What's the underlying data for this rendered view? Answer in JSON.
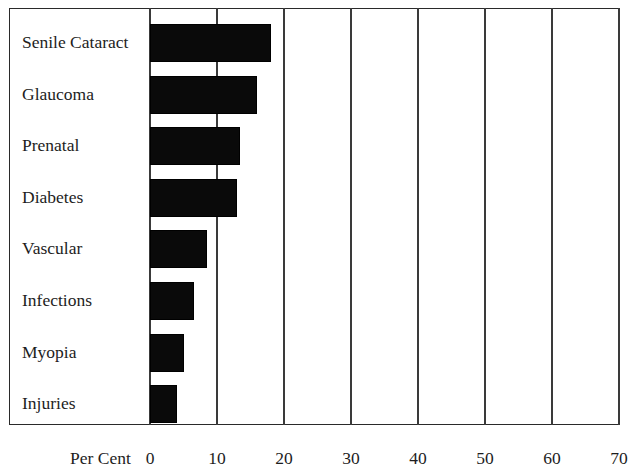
{
  "chart_data": {
    "type": "bar",
    "orientation": "horizontal",
    "title": "",
    "subtitle": "",
    "xlabel": "Per Cent",
    "ylabel": "",
    "categories": [
      "Senile Cataract",
      "Glaucoma",
      "Prenatal",
      "Diabetes",
      "Vascular",
      "Infections",
      "Myopia",
      "Injuries"
    ],
    "values": [
      18,
      16,
      13.5,
      13,
      8.5,
      6.5,
      5,
      4
    ],
    "xlim": [
      0,
      70
    ],
    "xticks": [
      0,
      10,
      20,
      30,
      40,
      50,
      60,
      70
    ],
    "xtick_labels": [
      "0",
      "10",
      "20",
      "30",
      "40",
      "50",
      "60",
      "70"
    ],
    "grid": "vertical",
    "legend": "none",
    "bar_color": "#0a0a0a",
    "frame_color": "#2a2a2a",
    "background": "#ffffff"
  }
}
